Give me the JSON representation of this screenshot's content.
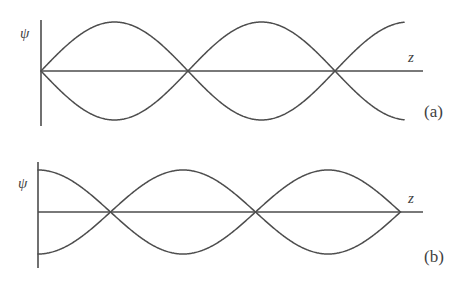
{
  "figure": {
    "title": "",
    "background_color": "#ffffff",
    "stroke_color": "#4d4d4d",
    "label_color": "#3f3f3f"
  },
  "chart_data": {
    "type": "line",
    "title": "",
    "xlabel": "z",
    "ylabel": "ψ",
    "grid": false,
    "legend": "none",
    "panels": [
      {
        "id": "a",
        "label": "(a)",
        "xlabel": "z",
        "ylabel": "ψ",
        "boundary_at_origin": "node",
        "mode_form": "sin",
        "node_count_shown": 3,
        "amplitude": 1.0,
        "half_wavelength_px": 147,
        "x_start": 0.0,
        "x_end": 2.47,
        "axis_x_end": 2.59,
        "nodes_x": [
          0.0,
          1.0,
          2.0
        ],
        "antinodes_x": [
          0.5,
          1.5
        ],
        "series": [
          {
            "name": "ψ positive branch",
            "formula": "sin(pi * x)",
            "sign": 1
          },
          {
            "name": "ψ negative branch",
            "formula": "-sin(pi * x)",
            "sign": -1
          }
        ],
        "geometry_px": {
          "origin_x": 41,
          "axis_y": 71,
          "v_axis_top": 20,
          "v_axis_bottom": 126,
          "amplitude_px": 49,
          "curve_end_x": 405,
          "axis_end_x": 423
        },
        "label_positions_px": {
          "ylabel": {
            "x": 20,
            "y": 38
          },
          "xlabel": {
            "x": 408,
            "y": 62
          },
          "panel_label": {
            "x": 424,
            "y": 117
          }
        }
      },
      {
        "id": "b",
        "label": "(b)",
        "xlabel": "z",
        "ylabel": "ψ",
        "boundary_at_origin": "antinode",
        "mode_form": "cos",
        "node_count_shown": 3,
        "amplitude": 1.0,
        "half_wavelength_px": 145,
        "x_start": 0.0,
        "x_end": 2.5,
        "axis_x_end": 2.66,
        "nodes_x": [
          0.5,
          1.5,
          2.5
        ],
        "antinodes_x": [
          0.0,
          1.0,
          2.0
        ],
        "series": [
          {
            "name": "ψ positive branch",
            "formula": "cos(pi * x)",
            "sign": 1
          },
          {
            "name": "ψ negative branch",
            "formula": "-cos(pi * x)",
            "sign": -1
          }
        ],
        "geometry_px": {
          "origin_x": 38,
          "axis_y": 212,
          "v_axis_top": 162,
          "v_axis_bottom": 268,
          "amplitude_px": 42,
          "curve_end_x": 400,
          "axis_end_x": 423
        },
        "label_positions_px": {
          "ylabel": {
            "x": 18,
            "y": 188
          },
          "xlabel": {
            "x": 408,
            "y": 203
          },
          "panel_label": {
            "x": 424,
            "y": 262
          }
        }
      }
    ]
  }
}
